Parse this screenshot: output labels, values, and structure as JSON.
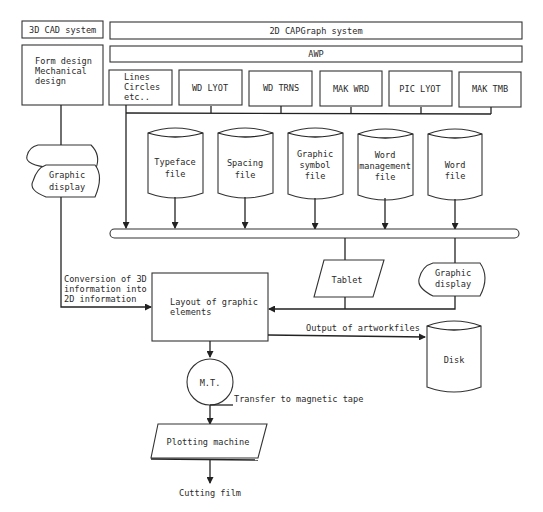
{
  "diagram": {
    "top_row": {
      "cad_system": "3D CAD system",
      "capgraph_system": "2D CAPGraph system"
    },
    "cad_box": [
      "Form design",
      "Mechanical",
      "design"
    ],
    "awp_label": "AWP",
    "modules": [
      {
        "lines": [
          "Lines",
          "Circles",
          "etc.."
        ]
      },
      {
        "lines": [
          "WD LYOT"
        ]
      },
      {
        "lines": [
          "WD TRNS"
        ]
      },
      {
        "lines": [
          "MAK WRD"
        ]
      },
      {
        "lines": [
          "PIC LYOT"
        ]
      },
      {
        "lines": [
          "MAK TMB"
        ]
      }
    ],
    "files": [
      {
        "lines": [
          "Typeface",
          "file"
        ]
      },
      {
        "lines": [
          "Spacing",
          "file"
        ]
      },
      {
        "lines": [
          "Graphic",
          "symbol",
          "file"
        ]
      },
      {
        "lines": [
          "Word",
          "management",
          "file"
        ]
      },
      {
        "lines": [
          "Word",
          "file"
        ]
      }
    ],
    "left_display": [
      "Graphic",
      "display"
    ],
    "right_display": [
      "Graphic",
      "display"
    ],
    "tablet": "Tablet",
    "conversion_label": [
      "Conversion of 3D",
      "information into",
      "2D information"
    ],
    "layout_box": [
      "Layout of graphic",
      "elements"
    ],
    "output_label": "Output of artworkfiles",
    "disk": "Disk",
    "mt": "M.T.",
    "transfer_label": "Transfer to magnetic tape",
    "plotter": "Plotting machine",
    "cutting": "Cutting film"
  }
}
